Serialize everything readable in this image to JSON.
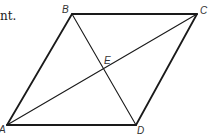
{
  "partial_text": "nt.",
  "diagram": {
    "type": "parallelogram with diagonals",
    "points": {
      "A": {
        "label": "A",
        "x": 7,
        "y": 125
      },
      "B": {
        "label": "B",
        "x": 72,
        "y": 14
      },
      "C": {
        "label": "C",
        "x": 197,
        "y": 14
      },
      "D": {
        "label": "D",
        "x": 136,
        "y": 125
      },
      "E": {
        "label": "E",
        "x": 105,
        "y": 70
      }
    },
    "segments": [
      "AB",
      "BC",
      "CD",
      "DA",
      "AC",
      "BD"
    ],
    "stroke_color": "#1a1a1a"
  }
}
